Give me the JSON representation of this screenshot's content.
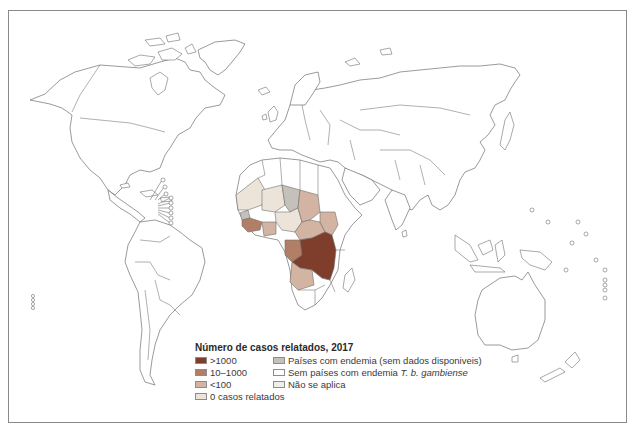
{
  "map": {
    "title": "Número de casos relatados, 2017",
    "colors": {
      "over_1000": "#7f3e2c",
      "10_1000": "#b27f66",
      "under_100": "#d3b3a2",
      "zero": "#ece4d9",
      "endemic_no_data": "#c4c1bb",
      "non_endemic": "#ffffff",
      "not_applicable": "#eeeeea",
      "outline": "#6e6e6e"
    }
  },
  "legend": {
    "title": "Número de casos relatados, 2017",
    "items": [
      {
        "key": "over_1000",
        "label": ">1000",
        "color": "#7f3e2c"
      },
      {
        "key": "endemic_no_data",
        "label": "Países com endemia (sem dados disponiveis)",
        "color": "#c4c1bb"
      },
      {
        "key": "10_1000",
        "label": "10–1000",
        "color": "#b27f66"
      },
      {
        "key": "non_endemic",
        "label_prefix": "Sem países com endemia ",
        "label_italic": "T. b. gambiense",
        "color": "#ffffff"
      },
      {
        "key": "under_100",
        "label": "<100",
        "color": "#d3b3a2"
      },
      {
        "key": "not_applicable",
        "label": "Não se aplica",
        "color": "#eeeeea"
      },
      {
        "key": "zero",
        "label": "0 casos relatados",
        "color": "#ece4d9"
      }
    ]
  }
}
